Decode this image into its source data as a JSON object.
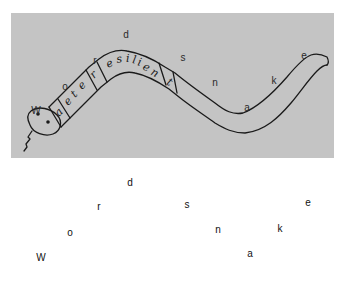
{
  "photo": {
    "background_color": "#c4c4c4",
    "ink_color": "#1a1a1a",
    "snake_body_text": [
      "a",
      "e",
      "t",
      "e",
      "r",
      "e",
      "s",
      "i",
      "l",
      "i",
      "e",
      "n",
      "t"
    ],
    "boxed_letters": [
      "a",
      "r",
      "t"
    ],
    "scattered_letters": [
      {
        "char": "d",
        "x": 115,
        "y": 22
      },
      {
        "char": "r",
        "x": 84,
        "y": 48
      },
      {
        "char": "s",
        "x": 172,
        "y": 45
      },
      {
        "char": "e",
        "x": 293,
        "y": 43
      },
      {
        "char": "o",
        "x": 54,
        "y": 74
      },
      {
        "char": "n",
        "x": 204,
        "y": 70
      },
      {
        "char": "k",
        "x": 263,
        "y": 68
      },
      {
        "char": "W",
        "x": 25,
        "y": 98
      },
      {
        "char": "a",
        "x": 236,
        "y": 95
      }
    ]
  },
  "letters": [
    {
      "char": "d",
      "x": 130,
      "y": 183
    },
    {
      "char": "r",
      "x": 99,
      "y": 207
    },
    {
      "char": "s",
      "x": 187,
      "y": 205
    },
    {
      "char": "e",
      "x": 308,
      "y": 203
    },
    {
      "char": "o",
      "x": 70,
      "y": 233
    },
    {
      "char": "n",
      "x": 218,
      "y": 230
    },
    {
      "char": "k",
      "x": 280,
      "y": 229
    },
    {
      "char": "W",
      "x": 41,
      "y": 258
    },
    {
      "char": "a",
      "x": 250,
      "y": 254
    }
  ]
}
